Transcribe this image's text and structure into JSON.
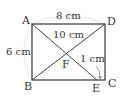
{
  "diagram": {
    "type": "geometry-rectangle",
    "points": {
      "A": {
        "label": "A",
        "x": 32,
        "y": 24
      },
      "D": {
        "label": "D",
        "x": 105,
        "y": 24
      },
      "B": {
        "label": "B",
        "x": 32,
        "y": 80
      },
      "C": {
        "label": "C",
        "x": 105,
        "y": 80
      },
      "E": {
        "label": "E",
        "x": 97,
        "y": 80
      },
      "F": {
        "label": "F",
        "x": 66,
        "y": 55
      }
    },
    "measurements": {
      "AD": "8 cm",
      "AB": "6 cm",
      "BD": "10 cm",
      "EC": "1 cm"
    },
    "colors": {
      "line": "#444444",
      "dotted": "#aaaaaa",
      "text": "#333333"
    }
  }
}
